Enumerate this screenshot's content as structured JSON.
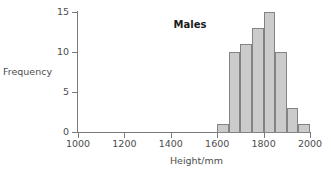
{
  "chart_data": {
    "type": "bar",
    "title": "Males",
    "xlabel": "Height/mm",
    "ylabel": "Frequency",
    "xlim": [
      1000,
      2000
    ],
    "ylim": [
      0,
      15
    ],
    "grid": false,
    "legend": null,
    "bin_width": 50,
    "bin_edges": [
      1600,
      1650,
      1700,
      1750,
      1800,
      1850,
      1900,
      1950,
      2000
    ],
    "categories": [
      "1600-1650",
      "1650-1700",
      "1700-1750",
      "1750-1800",
      "1800-1850",
      "1850-1900",
      "1900-1950",
      "1950-2000"
    ],
    "values": [
      1,
      10,
      11,
      13,
      15,
      10,
      3,
      1
    ],
    "xticks": [
      1000,
      1200,
      1400,
      1600,
      1800,
      2000
    ],
    "xtick_labels": [
      "1000",
      "1200",
      "1400",
      "1600",
      "1800",
      "2000"
    ],
    "yticks": [
      0,
      5,
      10,
      15
    ],
    "ytick_labels": [
      "0",
      "5",
      "10",
      "15"
    ],
    "colors": {
      "bar_fill": "#cbcbcb",
      "bar_stroke": "#838383",
      "axis": "#7a7a7a",
      "text": "#4d4d4d",
      "title": "#1a1a1a",
      "background": "#ffffff"
    }
  }
}
